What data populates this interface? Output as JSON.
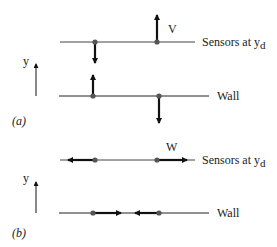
{
  "panel_a": {
    "label": "(a)",
    "axis_label": "y",
    "top_line_label": "Sensors at y",
    "top_line_label_sub": "d",
    "bottom_line_label": "Wall",
    "velocity_label": "V"
  },
  "panel_b": {
    "label": "(b)",
    "axis_label": "y",
    "top_line_label": "Sensors at y",
    "top_line_label_sub": "d",
    "bottom_line_label": "Wall",
    "velocity_label": "W"
  },
  "colors": {
    "line": "#333333",
    "arrow": "#111111",
    "dot": "#555555"
  }
}
